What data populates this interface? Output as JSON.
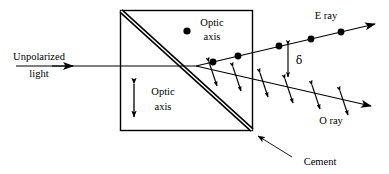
{
  "figure": {
    "kind": "nicol-prism-double-refraction-diagram",
    "canvas": {
      "width": 389,
      "height": 174
    },
    "colors": {
      "stroke": "#000000",
      "background": "#ffffff",
      "cement_fill": "#b3b3b3"
    }
  },
  "labels": {
    "incident": {
      "line1": "Unpolarized",
      "line2": "light"
    },
    "optic_axis_upper": {
      "line1": "Optic",
      "line2": "axis"
    },
    "optic_axis_lower": {
      "line1": "Optic",
      "line2": "axis"
    },
    "e_ray": "E ray",
    "o_ray": "O ray",
    "cement": "Cement",
    "delta": "δ"
  },
  "geometry": {
    "prism": {
      "x": 120,
      "y": 10,
      "width": 133,
      "height": 121
    },
    "cement_line": {
      "x1": 121,
      "y1": 11,
      "x2": 252,
      "y2": 130
    },
    "incident_ray": {
      "x1": 16,
      "y1": 66,
      "x2": 196,
      "y2": 66
    },
    "incident_arrow_at": {
      "x": 72,
      "y": 66
    },
    "split_point": {
      "x": 196,
      "y": 66
    },
    "e_ray": {
      "x1": 196,
      "y1": 66,
      "x2": 376,
      "y2": 24
    },
    "o_ray": {
      "x1": 196,
      "y1": 66,
      "x2": 372,
      "y2": 106
    },
    "delta_bar": {
      "x": 288,
      "y1": 45,
      "y2": 76
    },
    "optic_axis_arrow_lower": {
      "x": 134,
      "y1": 83,
      "y2": 118
    },
    "optic_axis_dot_upper": {
      "x": 187,
      "y": 31,
      "r": 3.6
    },
    "cement_pointer": {
      "x1": 292,
      "y1": 157,
      "x2": 256,
      "y2": 135
    }
  },
  "markers": {
    "e_ray_dots": [
      {
        "x": 213,
        "y": 62,
        "r": 3.4
      },
      {
        "x": 238,
        "y": 56,
        "r": 3.4
      },
      {
        "x": 279,
        "y": 46,
        "r": 3.4
      },
      {
        "x": 311,
        "y": 39,
        "r": 3.4
      },
      {
        "x": 341,
        "y": 32,
        "r": 3.4
      }
    ],
    "o_ray_double_arrows": [
      {
        "x": 213,
        "y": 74
      },
      {
        "x": 237,
        "y": 79
      },
      {
        "x": 264,
        "y": 85
      },
      {
        "x": 289,
        "y": 91
      },
      {
        "x": 316,
        "y": 97
      },
      {
        "x": 344,
        "y": 103
      }
    ]
  },
  "text_positions": {
    "incident_line1": {
      "x": 39,
      "y": 60
    },
    "incident_line2": {
      "x": 39,
      "y": 76
    },
    "optic_axis_upper_line1": {
      "x": 212,
      "y": 26
    },
    "optic_axis_upper_line2": {
      "x": 212,
      "y": 40
    },
    "optic_axis_lower_line1": {
      "x": 163,
      "y": 95
    },
    "optic_axis_lower_line2": {
      "x": 163,
      "y": 110
    },
    "e_ray": {
      "x": 326,
      "y": 18
    },
    "o_ray": {
      "x": 330,
      "y": 122
    },
    "cement": {
      "x": 320,
      "y": 164
    },
    "delta": {
      "x": 297,
      "y": 63
    }
  }
}
